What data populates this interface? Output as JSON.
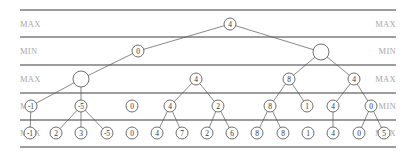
{
  "diagram": {
    "colors": {
      "rule": "#3a3a3a",
      "label": "#a8a8a8",
      "node_stroke": "#4a4a4a",
      "edge": "#555555",
      "text": "#333333"
    },
    "rules_y": [
      10,
      37,
      65,
      93,
      120,
      147
    ],
    "rules_x": [
      20,
      396
    ],
    "levels": [
      {
        "label": "MAX",
        "y": 24
      },
      {
        "label": "MIN",
        "y": 51
      },
      {
        "label": "MAX",
        "y": 79
      },
      {
        "label": "MIN",
        "y": 106
      },
      {
        "label": "MAX",
        "y": 133
      }
    ],
    "node_radius": 6,
    "large_node_radius": 8,
    "nodes": [
      {
        "id": "r",
        "x": 230,
        "y": 24,
        "value": "4"
      },
      {
        "id": "a",
        "x": 138,
        "y": 51,
        "value": "0"
      },
      {
        "id": "b",
        "x": 321,
        "y": 52,
        "value": "",
        "large": true
      },
      {
        "id": "a1",
        "x": 81,
        "y": 79,
        "value": "",
        "large": true
      },
      {
        "id": "a2",
        "x": 196,
        "y": 79,
        "value": "4"
      },
      {
        "id": "b1",
        "x": 289,
        "y": 79,
        "value": "8"
      },
      {
        "id": "b2",
        "x": 354,
        "y": 79,
        "value": "4"
      },
      {
        "id": "m1",
        "x": 31,
        "y": 106,
        "value": "-1"
      },
      {
        "id": "m2",
        "x": 81,
        "y": 106,
        "value": "-5"
      },
      {
        "id": "m3",
        "x": 132,
        "y": 106,
        "value": "0"
      },
      {
        "id": "m4",
        "x": 170,
        "y": 106,
        "value": "4"
      },
      {
        "id": "m5",
        "x": 218,
        "y": 106,
        "value": "2"
      },
      {
        "id": "m6",
        "x": 270,
        "y": 106,
        "value": "8"
      },
      {
        "id": "m7",
        "x": 307,
        "y": 106,
        "value": "1"
      },
      {
        "id": "m8",
        "x": 333,
        "y": 106,
        "value": "4"
      },
      {
        "id": "m9",
        "x": 371,
        "y": 106,
        "value": "0"
      },
      {
        "id": "l1",
        "x": 30,
        "y": 133,
        "value": "-1"
      },
      {
        "id": "l2",
        "x": 56,
        "y": 133,
        "value": "2"
      },
      {
        "id": "l3",
        "x": 81,
        "y": 133,
        "value": "3"
      },
      {
        "id": "l4",
        "x": 107,
        "y": 133,
        "value": "-5"
      },
      {
        "id": "l5",
        "x": 132,
        "y": 133,
        "value": "0"
      },
      {
        "id": "l6",
        "x": 157,
        "y": 133,
        "value": "4"
      },
      {
        "id": "l7",
        "x": 182,
        "y": 133,
        "value": "7"
      },
      {
        "id": "l8",
        "x": 207,
        "y": 133,
        "value": "2"
      },
      {
        "id": "l9",
        "x": 232,
        "y": 133,
        "value": "6"
      },
      {
        "id": "l10",
        "x": 257,
        "y": 133,
        "value": "8"
      },
      {
        "id": "l11",
        "x": 283,
        "y": 133,
        "value": "8"
      },
      {
        "id": "l12",
        "x": 308,
        "y": 133,
        "value": "1"
      },
      {
        "id": "l13",
        "x": 333,
        "y": 133,
        "value": "4"
      },
      {
        "id": "l14",
        "x": 359,
        "y": 133,
        "value": "0"
      },
      {
        "id": "l15",
        "x": 384,
        "y": 133,
        "value": "5"
      }
    ],
    "edges": [
      [
        "r",
        "a"
      ],
      [
        "r",
        "b"
      ],
      [
        "a",
        "a1"
      ],
      [
        "b",
        "b1"
      ],
      [
        "b",
        "b2"
      ],
      [
        "a1",
        "m1"
      ],
      [
        "a1",
        "m2"
      ],
      [
        "a2",
        "m4"
      ],
      [
        "a2",
        "m5"
      ],
      [
        "b1",
        "m6"
      ],
      [
        "b1",
        "m7"
      ],
      [
        "b2",
        "m8"
      ],
      [
        "b2",
        "m9"
      ],
      [
        "m1",
        "l1"
      ],
      [
        "m2",
        "l2"
      ],
      [
        "m2",
        "l3"
      ],
      [
        "m2",
        "l4"
      ],
      [
        "m4",
        "l6"
      ],
      [
        "m4",
        "l7"
      ],
      [
        "m5",
        "l8"
      ],
      [
        "m5",
        "l9"
      ],
      [
        "m6",
        "l10"
      ],
      [
        "m6",
        "l11"
      ],
      [
        "m8",
        "l13"
      ],
      [
        "m9",
        "l14"
      ],
      [
        "m9",
        "l15"
      ]
    ]
  }
}
